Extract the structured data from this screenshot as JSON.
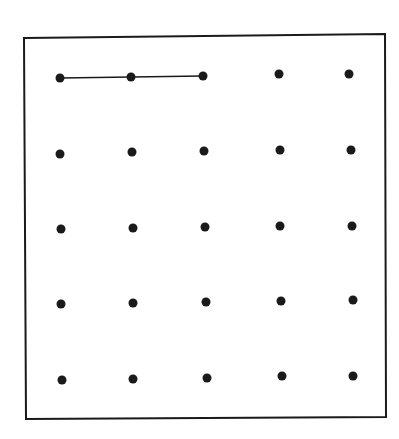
{
  "diagram": {
    "type": "dot-grid",
    "rows": 5,
    "cols": 5,
    "frame": {
      "points": [
        [
          24,
          38
        ],
        [
          385,
          34
        ],
        [
          386,
          417
        ],
        [
          26,
          419
        ]
      ],
      "stroke": "#1a1a1a"
    },
    "dot_color": "#1a1a1a",
    "dot_radius": 4.5,
    "dots": [
      [
        [
          60,
          78
        ],
        [
          131,
          77
        ],
        [
          203,
          76
        ],
        [
          279,
          74
        ],
        [
          349,
          74
        ]
      ],
      [
        [
          60,
          154
        ],
        [
          132,
          152
        ],
        [
          204,
          151
        ],
        [
          280,
          150
        ],
        [
          351,
          150
        ]
      ],
      [
        [
          61,
          229
        ],
        [
          133,
          228
        ],
        [
          205,
          227
        ],
        [
          280,
          226
        ],
        [
          352,
          226
        ]
      ],
      [
        [
          61,
          304
        ],
        [
          133,
          303
        ],
        [
          206,
          302
        ],
        [
          281,
          301
        ],
        [
          353,
          300
        ]
      ],
      [
        [
          62,
          380
        ],
        [
          133,
          379
        ],
        [
          207,
          378
        ],
        [
          282,
          376
        ],
        [
          353,
          376
        ]
      ]
    ],
    "segments": [
      {
        "from": [
          60,
          78
        ],
        "to": [
          203,
          76
        ],
        "label": "connects dots 1-3 of top row"
      }
    ]
  }
}
